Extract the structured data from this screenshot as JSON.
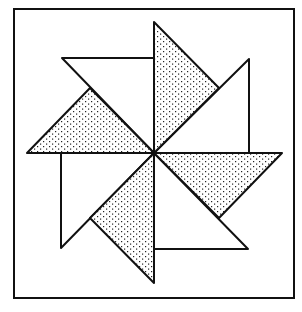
{
  "diagram": {
    "title": "",
    "colors": {
      "stroke": "#111111",
      "fill_white": "#ffffff",
      "dot": "#222222"
    },
    "frame": {
      "x": 14,
      "y": 9,
      "width": 280,
      "height": 289
    },
    "center": [
      154,
      153
    ],
    "triangles": [
      {
        "name": "top-shaded",
        "shaded": true,
        "points": "154,22 154,153 219,88"
      },
      {
        "name": "top-left-white",
        "shaded": false,
        "points": "62,58 154,58 154,153"
      },
      {
        "name": "left-shaded",
        "shaded": true,
        "points": "27,153 154,153 90,88"
      },
      {
        "name": "bottom-left-white",
        "shaded": false,
        "points": "61,153 61,248 154,153"
      },
      {
        "name": "bottom-shaded",
        "shaded": true,
        "points": "154,153 154,283 90,218"
      },
      {
        "name": "bottom-right-white",
        "shaded": false,
        "points": "154,153 154,249 248,249"
      },
      {
        "name": "right-shaded",
        "shaded": true,
        "points": "154,153 282,153 219,218"
      },
      {
        "name": "top-right-white",
        "shaded": false,
        "points": "154,153 249,59 249,153"
      }
    ]
  }
}
